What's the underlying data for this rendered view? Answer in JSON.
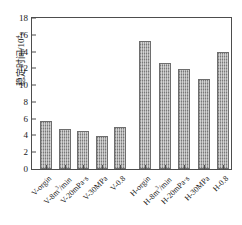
{
  "chart_data": {
    "type": "bar",
    "title": "",
    "subtitle": "",
    "xlabel": "",
    "ylabel": "稳定时间/10⁴s",
    "ylabel_text": "稳定时间/10",
    "ylabel_exponent": "4",
    "ylabel_unit": "s",
    "ylim": [
      0,
      18
    ],
    "ytick_step": 2,
    "yticks": [
      "18",
      "16",
      "14",
      "12",
      "10",
      "8",
      "6",
      "4",
      "2",
      "0"
    ],
    "ytick_values": [
      18,
      16,
      14,
      12,
      10,
      8,
      6,
      4,
      2,
      0
    ],
    "grid": false,
    "legend": null,
    "legend_position": "none",
    "categories": [
      "V-orgin",
      "V-8m³/min",
      "V-20mPa·s",
      "V-30MPa",
      "V-0.8",
      "H-orgin",
      "H-8m³/min",
      "H-20mPa·s",
      "H-30MPa",
      "H-0.8"
    ],
    "category_parts": [
      {
        "pre": "V-orgin",
        "sup": "",
        "post": ""
      },
      {
        "pre": "V-8m",
        "sup": "3",
        "post": "/min"
      },
      {
        "pre": "V-20mPa·s",
        "sup": "",
        "post": ""
      },
      {
        "pre": "V-30MPa",
        "sup": "",
        "post": ""
      },
      {
        "pre": "V-0.8",
        "sup": "",
        "post": ""
      },
      {
        "pre": "H-orgin",
        "sup": "",
        "post": ""
      },
      {
        "pre": "H-8m",
        "sup": "3",
        "post": "/min"
      },
      {
        "pre": "H-20mPa·s",
        "sup": "",
        "post": ""
      },
      {
        "pre": "H-30MPa",
        "sup": "",
        "post": ""
      },
      {
        "pre": "H-0.8",
        "sup": "",
        "post": ""
      }
    ],
    "values": [
      5.7,
      4.8,
      4.5,
      3.9,
      5.05,
      15.3,
      12.6,
      11.9,
      10.7,
      13.95
    ],
    "bar_color": "#8a8a8a",
    "bar_edge_color": "#6e6e6e",
    "bar_hatch": "vertical-stripes",
    "axis_color": "#4d4d4d",
    "background_color": "#ffffff",
    "groups": [
      {
        "name": "V",
        "indices": [
          0,
          1,
          2,
          3,
          4
        ]
      },
      {
        "name": "H",
        "indices": [
          5,
          6,
          7,
          8,
          9
        ]
      }
    ]
  }
}
